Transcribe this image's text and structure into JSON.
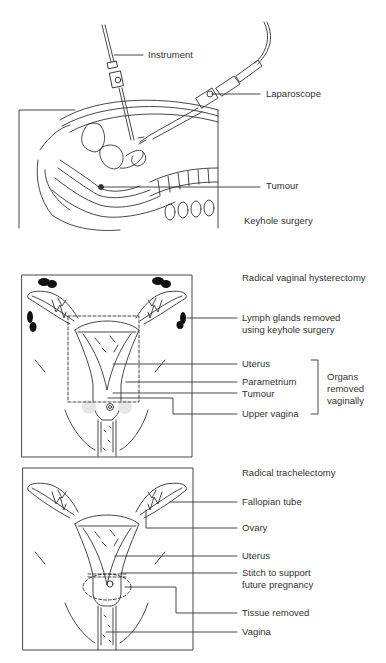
{
  "panels": [
    {
      "title": "Keyhole surgery",
      "labels": {
        "instrument": "Instrument",
        "laparoscope": "Laparoscope",
        "tumour": "Tumour"
      }
    },
    {
      "title": "Radical vaginal hysterectomy",
      "labels": {
        "lymph_line1": "Lymph glands removed",
        "lymph_line2": "using keyhole surgery",
        "uterus": "Uterus",
        "parametrium": "Parametrium",
        "tumour": "Tumour",
        "upper_vagina": "Upper vagina",
        "bracket_line1": "Organs",
        "bracket_line2": "removed",
        "bracket_line3": "vaginally"
      }
    },
    {
      "title": "Radical  trachelectomy",
      "labels": {
        "fallopian_tube": "Fallopian tube",
        "ovary": "Ovary",
        "uterus": "Uterus",
        "stitch_line1": "Stitch to support",
        "stitch_line2": "future pregnancy",
        "tissue_removed": "Tissue removed",
        "vagina": "Vagina"
      }
    }
  ]
}
